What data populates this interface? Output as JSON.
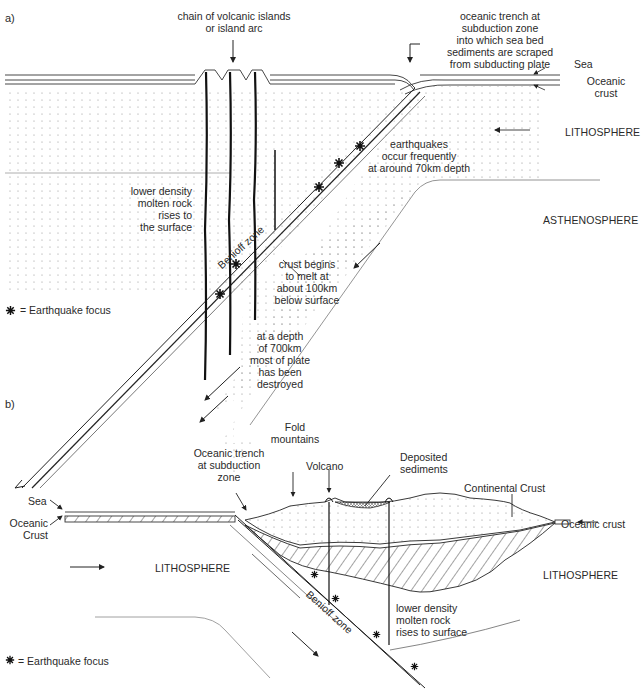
{
  "diagram_a": {
    "part_label": "a)",
    "labels": {
      "island_arc": [
        "chain of volcanic islands",
        "or island arc"
      ],
      "trench": [
        "oceanic trench at",
        "subduction zone",
        "into which sea bed",
        "sediments are scraped",
        "from subducting plate"
      ],
      "sea": "Sea",
      "oceanic_crust": [
        "Oceanic",
        "crust"
      ],
      "lithosphere": "LITHOSPHERE",
      "asthenosphere": "ASTHENOSPHERE",
      "earthquakes": [
        "earthquakes",
        "occur frequently",
        "at around 70km  depth"
      ],
      "molten_rock": [
        "lower density",
        "molten rock",
        "rises to",
        "the surface"
      ],
      "benioff": "Benioff zone",
      "crust_melt": [
        "crust begins",
        "to melt at",
        "about 100km",
        "below surface"
      ],
      "depth_700": [
        "at a depth",
        "of 700km",
        "most of plate",
        "has been",
        "destroyed"
      ]
    },
    "legend": "= Earthquake focus"
  },
  "diagram_b": {
    "part_label": "b)",
    "labels": {
      "fold_mountains": [
        "Fold",
        "mountains"
      ],
      "trench": [
        "Oceanic trench",
        "at subduction",
        "zone"
      ],
      "volcano": "Volcano",
      "deposited_sediments": [
        "Deposited",
        "sediments"
      ],
      "continental_crust": "Continental Crust",
      "sea": "Sea",
      "oceanic_crust_left": [
        "Oceanic",
        "Crust"
      ],
      "oceanic_crust_right": "Oceanic crust",
      "lithosphere_left": "LITHOSPHERE",
      "lithosphere_right": "LITHOSPHERE",
      "benioff": "Benioff zone",
      "molten_rock": [
        "lower density",
        "molten rock",
        "rises to surface"
      ]
    },
    "legend": "= Earthquake focus"
  }
}
